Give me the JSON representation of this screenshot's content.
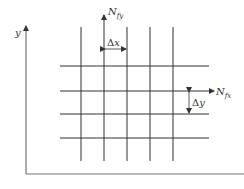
{
  "diagram": {
    "axis_labels": {
      "y": "y"
    },
    "flux_labels": {
      "y_flux_main": "N",
      "y_flux_sub": "fy",
      "x_flux_main": "N",
      "x_flux_sub": "fx"
    },
    "spacing_labels": {
      "dx_delta": "Δ",
      "dx_var": "x",
      "dy_delta": "Δ",
      "dy_var": "y"
    },
    "grid": {
      "vertical_lines_x": [
        81,
        104,
        127,
        150,
        173
      ],
      "horizontal_lines_y": [
        66,
        91,
        114,
        138
      ],
      "line_color": "#333333"
    }
  }
}
